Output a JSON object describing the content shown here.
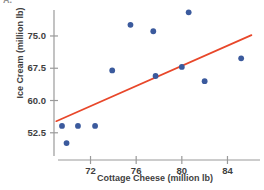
{
  "figure": {
    "corner_label": "A.",
    "accent_line_color": "#e8472a",
    "point_color": "#3b5a9d",
    "axis_color": "#9a9a9a",
    "text_color": "#3f3f3f"
  },
  "chart_data": {
    "type": "scatter",
    "title": "",
    "xlabel": "Cottage Cheese (million lb)",
    "ylabel": "Ice Cream (million lb)",
    "xlim": [
      68.8,
      86.5
    ],
    "ylim": [
      48.5,
      81.5
    ],
    "grid": false,
    "legend": null,
    "xticks": [
      72,
      76,
      80,
      84
    ],
    "xtick_labels": [
      "72",
      "76",
      "80",
      "84"
    ],
    "yticks": [
      52.5,
      60.0,
      67.5,
      75.0
    ],
    "ytick_labels": [
      "52.5",
      "60.0",
      "67.5",
      "75.0"
    ],
    "points": [
      {
        "x": 69.5,
        "y": 54.1
      },
      {
        "x": 69.9,
        "y": 50.1
      },
      {
        "x": 70.9,
        "y": 54.1
      },
      {
        "x": 72.4,
        "y": 54.1
      },
      {
        "x": 73.9,
        "y": 67.0
      },
      {
        "x": 75.5,
        "y": 77.6
      },
      {
        "x": 77.5,
        "y": 76.1
      },
      {
        "x": 77.7,
        "y": 65.7
      },
      {
        "x": 80.0,
        "y": 67.8
      },
      {
        "x": 80.6,
        "y": 80.5
      },
      {
        "x": 82.0,
        "y": 64.5
      },
      {
        "x": 85.2,
        "y": 69.8
      }
    ],
    "trendline": {
      "name": "linear fit",
      "x_start": 69.0,
      "y_start": 55.2,
      "x_end": 86.1,
      "y_end": 75.2
    }
  }
}
